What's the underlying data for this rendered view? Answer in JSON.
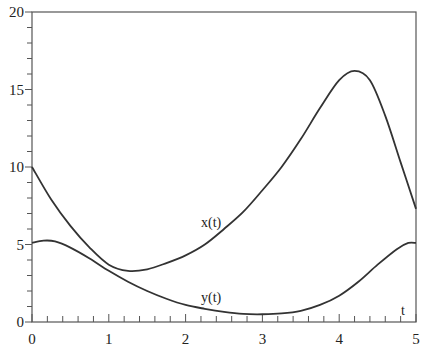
{
  "chart_data": {
    "type": "line",
    "title": "",
    "xlabel": "t",
    "ylabel": "",
    "xlim": [
      0,
      5
    ],
    "ylim": [
      0,
      20
    ],
    "x_ticks": [
      0,
      1,
      2,
      3,
      4,
      5
    ],
    "y_ticks": [
      0,
      5,
      10,
      15,
      20
    ],
    "x_minor_step": 0.2,
    "y_minor_step": 1,
    "grid": false,
    "legend": null,
    "annotations": [
      {
        "text": "x(t)",
        "x": 2.22,
        "y": 6.4
      },
      {
        "text": "y(t)",
        "x": 2.22,
        "y": 1.6
      },
      {
        "text": "t",
        "x": 4.84,
        "y": 0.9
      }
    ],
    "series": [
      {
        "name": "x(t)",
        "color": "#333333",
        "points": [
          [
            0,
            10
          ],
          [
            0.25,
            7.9
          ],
          [
            0.5,
            6.2
          ],
          [
            0.75,
            4.8
          ],
          [
            1,
            3.7
          ],
          [
            1.25,
            3.3
          ],
          [
            1.5,
            3.4
          ],
          [
            1.75,
            3.8
          ],
          [
            2,
            4.3
          ],
          [
            2.25,
            5.0
          ],
          [
            2.5,
            6.0
          ],
          [
            2.75,
            7.1
          ],
          [
            3,
            8.5
          ],
          [
            3.25,
            10.0
          ],
          [
            3.5,
            11.8
          ],
          [
            3.75,
            13.8
          ],
          [
            4,
            15.6
          ],
          [
            4.2,
            16.2
          ],
          [
            4.4,
            15.6
          ],
          [
            4.6,
            13.3
          ],
          [
            4.8,
            10.3
          ],
          [
            5,
            7.3
          ]
        ]
      },
      {
        "name": "y(t)",
        "color": "#333333",
        "points": [
          [
            0,
            5.1
          ],
          [
            0.15,
            5.25
          ],
          [
            0.3,
            5.2
          ],
          [
            0.5,
            4.8
          ],
          [
            0.75,
            4.1
          ],
          [
            1,
            3.3
          ],
          [
            1.25,
            2.6
          ],
          [
            1.5,
            2.0
          ],
          [
            1.75,
            1.5
          ],
          [
            2,
            1.1
          ],
          [
            2.25,
            0.85
          ],
          [
            2.5,
            0.65
          ],
          [
            2.75,
            0.52
          ],
          [
            3,
            0.5
          ],
          [
            3.25,
            0.55
          ],
          [
            3.5,
            0.72
          ],
          [
            3.75,
            1.1
          ],
          [
            4,
            1.7
          ],
          [
            4.25,
            2.6
          ],
          [
            4.5,
            3.7
          ],
          [
            4.75,
            4.7
          ],
          [
            4.9,
            5.1
          ],
          [
            5,
            5.1
          ]
        ]
      }
    ]
  },
  "labels": {
    "x_axis_name": "t",
    "x_curve": "x(t)",
    "y_curve": "y(t)"
  }
}
